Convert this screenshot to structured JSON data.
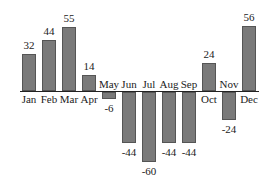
{
  "chart_data": {
    "type": "bar",
    "title": "",
    "xlabel": "",
    "ylabel": "",
    "categories": [
      "Jan",
      "Feb",
      "Mar",
      "Apr",
      "May",
      "Jun",
      "Jul",
      "Aug",
      "Sep",
      "Oct",
      "Nov",
      "Dec"
    ],
    "values": [
      32,
      44,
      55,
      14,
      -6,
      -44,
      -60,
      -44,
      -44,
      24,
      -24,
      56
    ],
    "value_labels": [
      "32",
      "44",
      "55",
      "14",
      "-6",
      "-44",
      "-60",
      "-44",
      "-44",
      "24",
      "-24",
      "56"
    ],
    "ylim": [
      -60,
      56
    ],
    "grid": false,
    "legend": null,
    "bar_color": "#7a7a7a"
  }
}
